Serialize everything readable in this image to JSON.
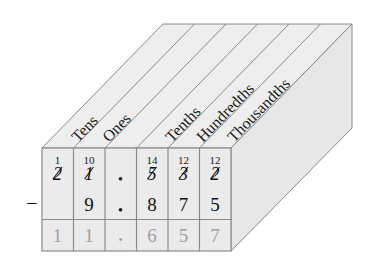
{
  "diagram": {
    "columns": [
      {
        "label": "Tens",
        "borrow": "1",
        "top_digit": "2",
        "struck": true,
        "subtrahend": "",
        "result": "1"
      },
      {
        "label": "Ones",
        "borrow": "10",
        "top_digit": "1",
        "struck": true,
        "subtrahend": "9",
        "result": "1"
      },
      {
        "label": "",
        "borrow": "",
        "top_digit": "•",
        "struck": false,
        "subtrahend": "•",
        "result": "•"
      },
      {
        "label": "Tenths",
        "borrow": "14",
        "top_digit": "5",
        "struck": true,
        "subtrahend": "8",
        "result": "6"
      },
      {
        "label": "Hundredths",
        "borrow": "12",
        "top_digit": "3",
        "struck": true,
        "subtrahend": "7",
        "result": "5"
      },
      {
        "label": "Thousandths",
        "borrow": "12",
        "top_digit": "2",
        "struck": true,
        "subtrahend": "5",
        "result": "7"
      }
    ],
    "operator": "−",
    "colors": {
      "face_front": "#ebebeb",
      "face_top": "#eeeeee",
      "face_side": "#e6e6e6",
      "edge": "#8a8a8a",
      "text": "#111111",
      "result_text": "#a0a0a0"
    }
  }
}
